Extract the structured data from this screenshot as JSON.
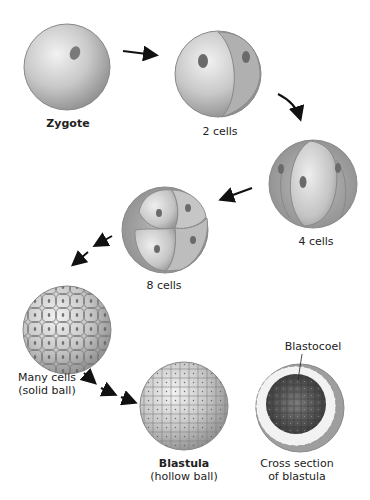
{
  "diagram": {
    "stages": [
      {
        "id": "zygote",
        "label": "Zygote",
        "bold": true
      },
      {
        "id": "two-cells",
        "label": "2 cells"
      },
      {
        "id": "four-cells",
        "label": "4 cells"
      },
      {
        "id": "eight-cells",
        "label": "8 cells"
      },
      {
        "id": "many-cells",
        "label_line1": "Many cells",
        "label_line2": "(solid ball)"
      },
      {
        "id": "blastula",
        "label_line1": "Blastula",
        "label_line2": "(hollow ball)"
      },
      {
        "id": "cross-section",
        "label_line1": "Cross section",
        "label_line2": "of blastula"
      }
    ],
    "callout": {
      "label": "Blastocoel"
    },
    "colors": {
      "cell_light": "#e6e6e6",
      "cell_mid": "#b8b8b8",
      "cell_dark": "#8a8a8a",
      "nucleus": "#6a6a6a",
      "arrow": "#111111",
      "cavity": "#4a4a4a"
    }
  }
}
